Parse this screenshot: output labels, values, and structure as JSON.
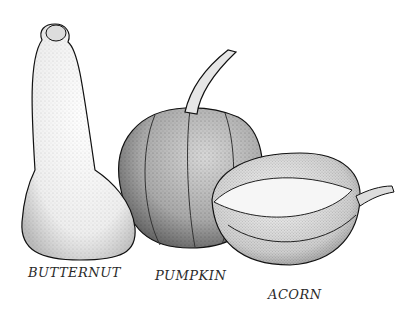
{
  "illustration": {
    "subject": "stippled pen illustration of three squashes",
    "colors": {
      "ink": "#1a1a1a",
      "paper": "#ffffff"
    },
    "labels": [
      {
        "id": "butternut",
        "text": "BUTTERNUT"
      },
      {
        "id": "pumpkin",
        "text": "PUMPKIN"
      },
      {
        "id": "acorn",
        "text": "ACORN"
      }
    ]
  }
}
